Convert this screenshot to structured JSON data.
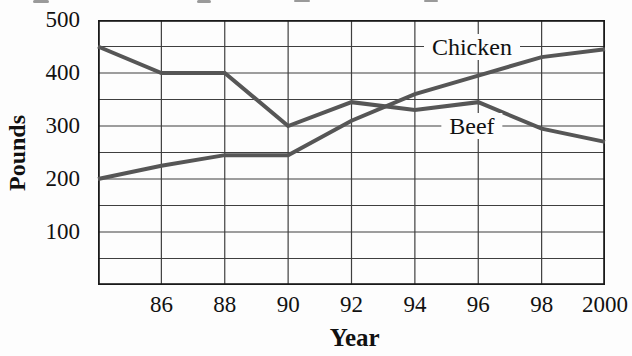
{
  "chart_data": {
    "type": "line",
    "title": "",
    "xlabel": "Year",
    "ylabel": "Pounds",
    "xlim": [
      1984,
      2000
    ],
    "ylim": [
      0,
      500
    ],
    "x": [
      1984,
      1986,
      1988,
      1990,
      1992,
      1994,
      1996,
      1998,
      2000
    ],
    "series": [
      {
        "name": "Chicken",
        "values": [
          200,
          225,
          245,
          245,
          310,
          360,
          395,
          430,
          445
        ]
      },
      {
        "name": "Beef",
        "values": [
          450,
          400,
          400,
          300,
          345,
          330,
          345,
          295,
          270
        ]
      }
    ],
    "y_tick_values": [
      500,
      400,
      300,
      200,
      100
    ],
    "y_tick_labels": [
      "500",
      "400",
      "300",
      "200",
      "100"
    ],
    "x_tick_values": [
      1986,
      1988,
      1990,
      1992,
      1994,
      1996,
      1998,
      2000
    ],
    "x_tick_labels": [
      "86",
      "88",
      "90",
      "92",
      "94",
      "96",
      "98",
      "2000"
    ],
    "grid": {
      "visible": true,
      "y_step": 50,
      "x_step_years": 2
    },
    "legend_position": "inline-annotations",
    "annotations": [
      {
        "text": "Chicken",
        "x_year": 1995.8,
        "y_value": 450
      },
      {
        "text": "Beef",
        "x_year": 1995.8,
        "y_value": 300
      }
    ],
    "colors": {
      "line": "#565656",
      "grid": "#3f3f3f",
      "border": "#1a1a1a",
      "text": "#111111",
      "background": "#fdfdfd"
    }
  },
  "layout_artifacts": {
    "cropped_title_note": "unreadable bottom edges of a cropped text line at top of scan"
  }
}
